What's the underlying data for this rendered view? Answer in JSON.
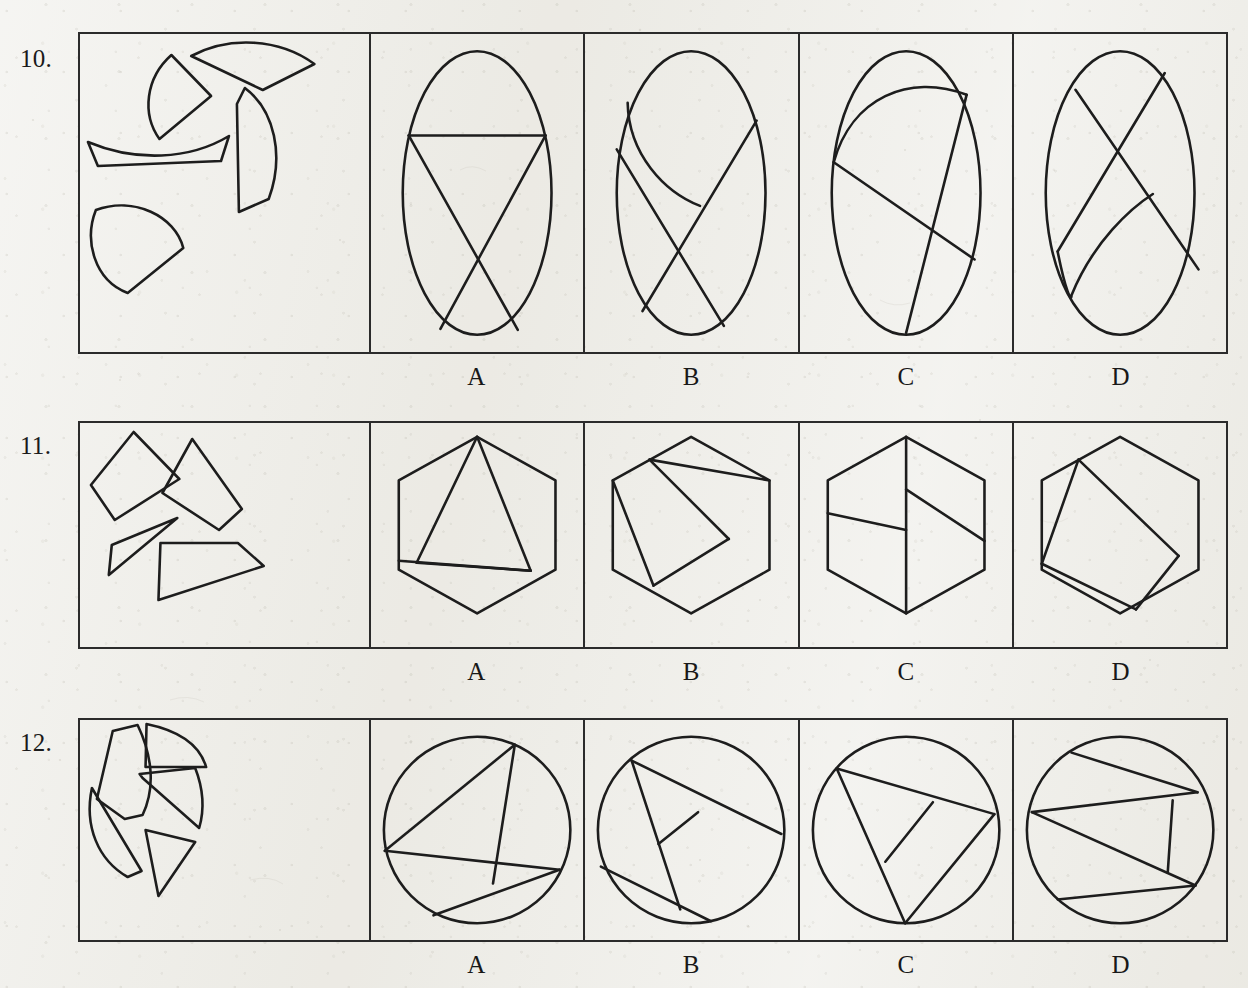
{
  "page": {
    "background_color": "#ecebe5",
    "ink_color": "#1d1d1d"
  },
  "option_labels": [
    "A",
    "B",
    "C",
    "D"
  ],
  "rows": [
    {
      "number": "10.",
      "prompt_shape": "ellipse-pieces",
      "prompt_description": "Five scattered pieces cut from an ellipse: a quarter-sector wedge, a long curved wedge, a tall curved quadrilateral, a thin crescent sliver, and a rounded dome piece.",
      "options": [
        {
          "label": "A",
          "figure": "ellipse",
          "description": "Upright ellipse with a horizontal chord near the top and two long chords crossing in an X below it."
        },
        {
          "label": "B",
          "figure": "ellipse",
          "description": "Upright ellipse containing a curved arc and two straight chords crossing near the lower middle."
        },
        {
          "label": "C",
          "figure": "ellipse",
          "description": "Upright ellipse with a curved arc across the top and two straight chords crossing at the centre."
        },
        {
          "label": "D",
          "figure": "ellipse",
          "description": "Upright ellipse with two chords crossing in an X at the top and a curved arc at the lower left."
        }
      ]
    },
    {
      "number": "11.",
      "prompt_shape": "hexagon-pieces",
      "prompt_description": "Four scattered straight-edged pieces cut from a hexagon: a diamond, a larger quadrilateral, a thin sliver triangle and a flat trapezoid.",
      "options": [
        {
          "label": "A",
          "figure": "hexagon",
          "description": "Hexagon with lines from the top vertex down to the left side and a triangle reaching the lower right vertex."
        },
        {
          "label": "B",
          "figure": "hexagon",
          "description": "Hexagon crossed by a wide diagonal band plus a line to the bottom-left area."
        },
        {
          "label": "C",
          "figure": "hexagon",
          "description": "Hexagon split by a vertical line through the centre with two slanted lines meeting it from the left and right."
        },
        {
          "label": "D",
          "figure": "hexagon",
          "description": "Hexagon with an inscribed tilted square touching four sides."
        }
      ]
    },
    {
      "number": "12.",
      "prompt_shape": "circle-pieces",
      "prompt_description": "Five scattered pieces cut from a circle: a rounded pentagon, a crescent segment, a curved wedge, a long curved sliver and a triangle.",
      "options": [
        {
          "label": "A",
          "figure": "circle",
          "description": "Circle with chords forming a triangle on the left and a slanted band across the lower right."
        },
        {
          "label": "B",
          "figure": "circle",
          "description": "Circle with chords meeting in a Y junction near the centre and a chord across the lower left."
        },
        {
          "label": "C",
          "figure": "circle",
          "description": "Circle with a large inscribed triangle and a short line from its interior to the upper right side."
        },
        {
          "label": "D",
          "figure": "circle",
          "description": "Circle with two long parallel-ish chords and a short vertical chord linking them on the right."
        }
      ]
    }
  ]
}
